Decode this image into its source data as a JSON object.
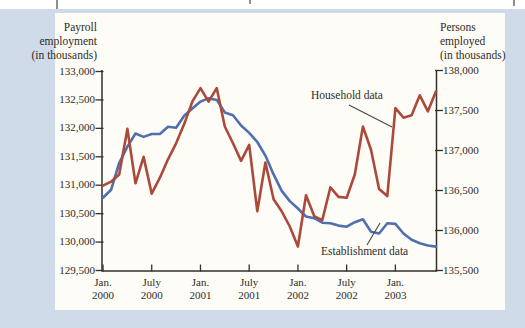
{
  "figure": {
    "left_axis_title_lines": [
      "Payroll",
      "employment",
      "(in thousands)"
    ],
    "right_axis_title_lines": [
      "Persons",
      "employed",
      "(in thousands)"
    ]
  },
  "chart_data": {
    "type": "line",
    "months": [
      "Jan. 2000",
      "Feb. 2000",
      "Mar. 2000",
      "Apr. 2000",
      "May 2000",
      "June 2000",
      "July 2000",
      "Aug. 2000",
      "Sept. 2000",
      "Oct. 2000",
      "Nov. 2000",
      "Dec. 2000",
      "Jan. 2001",
      "Feb. 2001",
      "Mar. 2001",
      "Apr. 2001",
      "May 2001",
      "June 2001",
      "July 2001",
      "Aug. 2001",
      "Sept. 2001",
      "Oct. 2001",
      "Nov. 2001",
      "Dec. 2001",
      "Jan. 2002",
      "Feb. 2002",
      "Mar. 2002",
      "Apr. 2002",
      "May 2002",
      "June 2002",
      "July 2002",
      "Aug. 2002",
      "Sept. 2002",
      "Oct. 2002",
      "Nov. 2002",
      "Dec. 2002",
      "Jan. 2003",
      "Feb. 2003",
      "Mar. 2003",
      "Apr. 2003",
      "May 2003",
      "June 2003"
    ],
    "series": [
      {
        "name": "Establishment data",
        "axis": "left",
        "color": "#4f6fae",
        "values": [
          130780,
          130920,
          131390,
          131680,
          131910,
          131850,
          131900,
          131900,
          132030,
          132010,
          132220,
          132350,
          132470,
          132530,
          132500,
          132280,
          132230,
          132050,
          131920,
          131760,
          131520,
          131190,
          130900,
          130720,
          130590,
          130450,
          130420,
          130340,
          130330,
          130290,
          130270,
          130350,
          130400,
          130180,
          130150,
          130330,
          130320,
          130150,
          130040,
          129980,
          129940,
          129920
        ]
      },
      {
        "name": "Household data",
        "axis": "right",
        "color": "#ab4a3b",
        "values": [
          136560,
          136610,
          136700,
          137270,
          136590,
          136920,
          136460,
          136660,
          136890,
          137090,
          137330,
          137610,
          137780,
          137610,
          137780,
          137300,
          137090,
          136870,
          137070,
          136240,
          136850,
          136390,
          136240,
          136050,
          135800,
          136440,
          136180,
          136130,
          136540,
          136420,
          136410,
          136700,
          137300,
          137010,
          136520,
          136430,
          137530,
          137410,
          137440,
          137690,
          137490,
          137740
        ]
      }
    ],
    "left_axis": {
      "label": "Payroll employment (in thousands)",
      "min": 129500,
      "max": 133000,
      "ticks": [
        {
          "label": "133,000",
          "value": 133000
        },
        {
          "label": "132,500",
          "value": 132500
        },
        {
          "label": "132,000",
          "value": 132000
        },
        {
          "label": "131,500",
          "value": 131500
        },
        {
          "label": "131,000",
          "value": 131000
        },
        {
          "label": "130,500",
          "value": 130500
        },
        {
          "label": "130,000",
          "value": 130000
        },
        {
          "label": "129,500",
          "value": 129500
        }
      ]
    },
    "right_axis": {
      "label": "Persons employed (in thousands)",
      "min": 135500,
      "max": 138000,
      "ticks": [
        {
          "label": "138,000",
          "value": 138000
        },
        {
          "label": "137,500",
          "value": 137500
        },
        {
          "label": "137,000",
          "value": 137000
        },
        {
          "label": "136,500",
          "value": 136500
        },
        {
          "label": "136,000",
          "value": 136000
        },
        {
          "label": "135,500",
          "value": 135500
        }
      ]
    },
    "x_ticks": [
      {
        "line1": "Jan.",
        "line2": "2000",
        "month_index": 0
      },
      {
        "line1": "July",
        "line2": "2000",
        "month_index": 6
      },
      {
        "line1": "Jan.",
        "line2": "2001",
        "month_index": 12
      },
      {
        "line1": "July",
        "line2": "2001",
        "month_index": 18
      },
      {
        "line1": "Jan.",
        "line2": "2002",
        "month_index": 24
      },
      {
        "line1": "July",
        "line2": "2002",
        "month_index": 30
      },
      {
        "line1": "Jan.",
        "line2": "2003",
        "month_index": 36
      }
    ],
    "annotations": [
      {
        "text": "Household data",
        "series": 1
      },
      {
        "text": "Establishment data",
        "series": 0
      }
    ],
    "grid": false,
    "legend_position": "inline-annotations",
    "axis_color": "#33312e"
  }
}
